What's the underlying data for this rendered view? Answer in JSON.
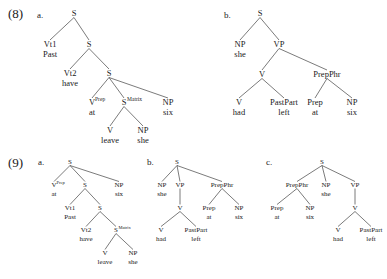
{
  "page": {
    "background_color": "#ffffff",
    "text_color": "#1a1a1a",
    "line_color": "#333333",
    "width": 387,
    "height": 279
  },
  "examples": [
    {
      "number": "(8)",
      "number_pos": [
        8,
        18
      ],
      "trees": [
        {
          "letter": "a.",
          "letter_pos": [
            37,
            18
          ],
          "font_size": 8.5,
          "word_font_size": 8.5,
          "sup_font_size": 5.5,
          "nodes": [
            {
              "id": "s1",
              "cat": "S",
              "sup": "",
              "word": "",
              "x": 74,
              "y": 16
            },
            {
              "id": "vt1",
              "cat": "Vt1",
              "sup": "",
              "word": "Past",
              "x": 50,
              "y": 47
            },
            {
              "id": "s2",
              "cat": "S",
              "sup": "",
              "word": "",
              "x": 89,
              "y": 47
            },
            {
              "id": "vt2",
              "cat": "Vt2",
              "sup": "",
              "word": "have",
              "x": 70,
              "y": 76
            },
            {
              "id": "s3",
              "cat": "S",
              "sup": "",
              "word": "",
              "x": 109,
              "y": 76
            },
            {
              "id": "vp1",
              "cat": "V",
              "sup": "Prep",
              "word": "at",
              "x": 92,
              "y": 105
            },
            {
              "id": "sm",
              "cat": "S",
              "sup": "Matrix",
              "word": "",
              "x": 124,
              "y": 105
            },
            {
              "id": "np1",
              "cat": "NP",
              "sup": "",
              "word": "six",
              "x": 168,
              "y": 105
            },
            {
              "id": "v2",
              "cat": "V",
              "sup": "",
              "word": "leave",
              "x": 110,
              "y": 133
            },
            {
              "id": "np2",
              "cat": "NP",
              "sup": "",
              "word": "she",
              "x": 143,
              "y": 133
            }
          ],
          "edges": [
            [
              "s1",
              "vt1"
            ],
            [
              "s1",
              "s2"
            ],
            [
              "s2",
              "vt2"
            ],
            [
              "s2",
              "s3"
            ],
            [
              "s3",
              "vp1"
            ],
            [
              "s3",
              "sm"
            ],
            [
              "s3",
              "np1"
            ],
            [
              "sm",
              "v2"
            ],
            [
              "sm",
              "np2"
            ]
          ]
        },
        {
          "letter": "b.",
          "letter_pos": [
            224,
            18
          ],
          "font_size": 8.5,
          "word_font_size": 8.5,
          "sup_font_size": 5.5,
          "nodes": [
            {
              "id": "s1",
              "cat": "S",
              "sup": "",
              "word": "",
              "x": 260,
              "y": 16
            },
            {
              "id": "np1",
              "cat": "NP",
              "sup": "",
              "word": "she",
              "x": 240,
              "y": 47
            },
            {
              "id": "vp",
              "cat": "VP",
              "sup": "",
              "word": "",
              "x": 279,
              "y": 47
            },
            {
              "id": "v1",
              "cat": "V",
              "sup": "",
              "word": "",
              "x": 262,
              "y": 77
            },
            {
              "id": "pp",
              "cat": "PrepPhr",
              "sup": "",
              "word": "",
              "x": 327,
              "y": 77
            },
            {
              "id": "v2",
              "cat": "V",
              "sup": "",
              "word": "had",
              "x": 239,
              "y": 105
            },
            {
              "id": "pt",
              "cat": "PastPart",
              "sup": "",
              "word": "left",
              "x": 284,
              "y": 105
            },
            {
              "id": "pr",
              "cat": "Prep",
              "sup": "",
              "word": "at",
              "x": 315,
              "y": 105
            },
            {
              "id": "np2",
              "cat": "NP",
              "sup": "",
              "word": "six",
              "x": 352,
              "y": 105
            }
          ],
          "edges": [
            [
              "s1",
              "np1"
            ],
            [
              "s1",
              "vp"
            ],
            [
              "vp",
              "v1"
            ],
            [
              "vp",
              "pp"
            ],
            [
              "v1",
              "v2"
            ],
            [
              "v1",
              "pt"
            ],
            [
              "pp",
              "pr"
            ],
            [
              "pp",
              "np2"
            ]
          ]
        }
      ]
    },
    {
      "number": "(9)",
      "number_pos": [
        8,
        167
      ],
      "trees": [
        {
          "letter": "a.",
          "letter_pos": [
            38,
            165
          ],
          "font_size": 7,
          "word_font_size": 7,
          "sup_font_size": 4.5,
          "nodes": [
            {
              "id": "s1",
              "cat": "S",
              "sup": "",
              "word": "",
              "x": 70,
              "y": 164
            },
            {
              "id": "vp1",
              "cat": "V",
              "sup": "Prep",
              "word": "at",
              "x": 54,
              "y": 187
            },
            {
              "id": "s2",
              "cat": "S",
              "sup": "",
              "word": "",
              "x": 85,
              "y": 187
            },
            {
              "id": "np1",
              "cat": "NP",
              "sup": "",
              "word": "six",
              "x": 119,
              "y": 187
            },
            {
              "id": "vt1",
              "cat": "Vt1",
              "sup": "",
              "word": "Past",
              "x": 70,
              "y": 210
            },
            {
              "id": "s3",
              "cat": "S",
              "sup": "",
              "word": "",
              "x": 100,
              "y": 210
            },
            {
              "id": "vt2",
              "cat": "Vt2",
              "sup": "",
              "word": "have",
              "x": 86,
              "y": 232
            },
            {
              "id": "sm",
              "cat": "S",
              "sup": "Matrix",
              "word": "",
              "x": 116,
              "y": 232
            },
            {
              "id": "v2",
              "cat": "V",
              "sup": "",
              "word": "leave",
              "x": 105,
              "y": 255
            },
            {
              "id": "np2",
              "cat": "NP",
              "sup": "",
              "word": "she",
              "x": 133,
              "y": 255
            }
          ],
          "edges": [
            [
              "s1",
              "vp1"
            ],
            [
              "s1",
              "s2"
            ],
            [
              "s1",
              "np1"
            ],
            [
              "s2",
              "vt1"
            ],
            [
              "s2",
              "s3"
            ],
            [
              "s3",
              "vt2"
            ],
            [
              "s3",
              "sm"
            ],
            [
              "sm",
              "v2"
            ],
            [
              "sm",
              "np2"
            ]
          ]
        },
        {
          "letter": "b.",
          "letter_pos": [
            147,
            165
          ],
          "font_size": 7,
          "word_font_size": 7,
          "sup_font_size": 4.5,
          "nodes": [
            {
              "id": "s1",
              "cat": "S",
              "sup": "",
              "word": "",
              "x": 177,
              "y": 164
            },
            {
              "id": "np1",
              "cat": "NP",
              "sup": "",
              "word": "she",
              "x": 162,
              "y": 187
            },
            {
              "id": "vp",
              "cat": "VP",
              "sup": "",
              "word": "",
              "x": 180,
              "y": 187
            },
            {
              "id": "pp",
              "cat": "PrepPhr",
              "sup": "",
              "word": "",
              "x": 222,
              "y": 187
            },
            {
              "id": "v1",
              "cat": "V",
              "sup": "",
              "word": "",
              "x": 180,
              "y": 210
            },
            {
              "id": "pr",
              "cat": "Prep",
              "sup": "",
              "word": "at",
              "x": 209,
              "y": 210
            },
            {
              "id": "np2",
              "cat": "NP",
              "sup": "",
              "word": "six",
              "x": 239,
              "y": 210
            },
            {
              "id": "v2",
              "cat": "V",
              "sup": "",
              "word": "had",
              "x": 161,
              "y": 232
            },
            {
              "id": "pt",
              "cat": "PastPart",
              "sup": "",
              "word": "left",
              "x": 196,
              "y": 232
            }
          ],
          "edges": [
            [
              "s1",
              "np1"
            ],
            [
              "s1",
              "vp"
            ],
            [
              "s1",
              "pp"
            ],
            [
              "vp",
              "v1"
            ],
            [
              "pp",
              "pr"
            ],
            [
              "pp",
              "np2"
            ],
            [
              "v1",
              "v2"
            ],
            [
              "v1",
              "pt"
            ]
          ]
        },
        {
          "letter": "c.",
          "letter_pos": [
            266,
            165
          ],
          "font_size": 7,
          "word_font_size": 7,
          "sup_font_size": 4.5,
          "nodes": [
            {
              "id": "s1",
              "cat": "S",
              "sup": "",
              "word": "",
              "x": 322,
              "y": 164
            },
            {
              "id": "pp",
              "cat": "PrepPhr",
              "sup": "",
              "word": "",
              "x": 297,
              "y": 187
            },
            {
              "id": "np1",
              "cat": "NP",
              "sup": "",
              "word": "she",
              "x": 326,
              "y": 187
            },
            {
              "id": "vp",
              "cat": "VP",
              "sup": "",
              "word": "",
              "x": 355,
              "y": 187
            },
            {
              "id": "pr",
              "cat": "Prep",
              "sup": "",
              "word": "at",
              "x": 277,
              "y": 210
            },
            {
              "id": "np2",
              "cat": "NP",
              "sup": "",
              "word": "six",
              "x": 310,
              "y": 210
            },
            {
              "id": "v1",
              "cat": "V",
              "sup": "",
              "word": "",
              "x": 355,
              "y": 210
            },
            {
              "id": "v2",
              "cat": "V",
              "sup": "",
              "word": "had",
              "x": 338,
              "y": 232
            },
            {
              "id": "pt",
              "cat": "PastPart",
              "sup": "",
              "word": "left",
              "x": 371,
              "y": 232
            }
          ],
          "edges": [
            [
              "s1",
              "pp"
            ],
            [
              "s1",
              "np1"
            ],
            [
              "s1",
              "vp"
            ],
            [
              "pp",
              "pr"
            ],
            [
              "pp",
              "np2"
            ],
            [
              "vp",
              "v1"
            ],
            [
              "v1",
              "v2"
            ],
            [
              "v1",
              "pt"
            ]
          ]
        }
      ]
    }
  ]
}
